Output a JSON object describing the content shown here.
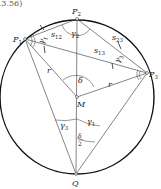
{
  "caption_fragment": "a.3.56)",
  "points": {
    "P1": {
      "label": "P",
      "sub": "1"
    },
    "P2": {
      "label": "P",
      "sub": "2"
    },
    "P3": {
      "label": "P",
      "sub": "3"
    },
    "M": {
      "label": "M"
    },
    "Q": {
      "label": "Q"
    }
  },
  "segments": {
    "s12": {
      "label": "s",
      "sub": "12"
    },
    "s23": {
      "label": "s",
      "sub": "23"
    },
    "s13": {
      "label": "s",
      "sub": "13"
    },
    "r_left": {
      "label": "r"
    },
    "r_right": {
      "label": "r"
    }
  },
  "angles": {
    "gamma2": {
      "label": "γ",
      "sub": "2"
    },
    "gamma1": {
      "label": "γ",
      "sub": "1"
    },
    "gamma3": {
      "label": "γ",
      "sub": "3"
    },
    "gamma3_top": {
      "label": "γ",
      "sub": "3"
    },
    "gamma1_top": {
      "label": "γ",
      "sub": "1"
    },
    "delta": {
      "label": "δ"
    },
    "delta_half": {
      "num": "δ",
      "den": "2"
    }
  },
  "colors": {
    "stroke": "#222222",
    "circle": "#111111",
    "background": "#ffffff"
  }
}
